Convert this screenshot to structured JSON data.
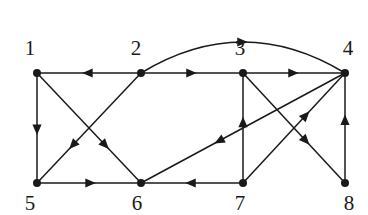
{
  "figure": {
    "kind": "directed-graph",
    "background_color": "#ffffff",
    "stroke_color": "#1a1a1a",
    "label_color": "#1a1a1a",
    "width": 368,
    "height": 215
  },
  "graph": {
    "directed": true,
    "node_count": 8,
    "edge_count": 14,
    "nodes": [
      {
        "id": "1",
        "label": "1",
        "x": 37,
        "y": 73,
        "label_x": 30,
        "label_y": 48
      },
      {
        "id": "2",
        "label": "2",
        "x": 141,
        "y": 73,
        "label_x": 136,
        "label_y": 48
      },
      {
        "id": "3",
        "label": "3",
        "x": 243,
        "y": 73,
        "label_x": 240,
        "label_y": 48
      },
      {
        "id": "4",
        "label": "4",
        "x": 345,
        "y": 73,
        "label_x": 348,
        "label_y": 48
      },
      {
        "id": "5",
        "label": "5",
        "x": 37,
        "y": 183,
        "label_x": 30,
        "label_y": 203
      },
      {
        "id": "6",
        "label": "6",
        "x": 141,
        "y": 183,
        "label_x": 137,
        "label_y": 203
      },
      {
        "id": "7",
        "label": "7",
        "x": 243,
        "y": 183,
        "label_x": 240,
        "label_y": 203
      },
      {
        "id": "8",
        "label": "8",
        "x": 345,
        "y": 183,
        "label_x": 349,
        "label_y": 203
      }
    ],
    "edges": [
      {
        "from": "2",
        "to": "1",
        "shape": "line",
        "arrow_at": 0.52
      },
      {
        "from": "2",
        "to": "3",
        "shape": "line",
        "arrow_at": 0.5
      },
      {
        "from": "3",
        "to": "4",
        "shape": "line",
        "arrow_at": 0.5
      },
      {
        "from": "1",
        "to": "5",
        "shape": "line",
        "arrow_at": 0.52
      },
      {
        "from": "1",
        "to": "6",
        "shape": "line",
        "arrow_at": 0.66
      },
      {
        "from": "2",
        "to": "5",
        "shape": "line",
        "arrow_at": 0.66
      },
      {
        "from": "5",
        "to": "6",
        "shape": "line",
        "arrow_at": 0.52
      },
      {
        "from": "7",
        "to": "6",
        "shape": "line",
        "arrow_at": 0.52
      },
      {
        "from": "7",
        "to": "3",
        "shape": "line",
        "arrow_at": 0.56
      },
      {
        "from": "4",
        "to": "6",
        "shape": "line",
        "arrow_at": 0.62
      },
      {
        "from": "7",
        "to": "4",
        "shape": "line",
        "arrow_at": 0.62
      },
      {
        "from": "3",
        "to": "8",
        "shape": "line",
        "arrow_at": 0.62
      },
      {
        "from": "8",
        "to": "4",
        "shape": "line",
        "arrow_at": 0.58
      },
      {
        "from": "2",
        "to": "4",
        "shape": "arc",
        "arc_height": 62,
        "arrow_at": 0.5
      }
    ]
  }
}
